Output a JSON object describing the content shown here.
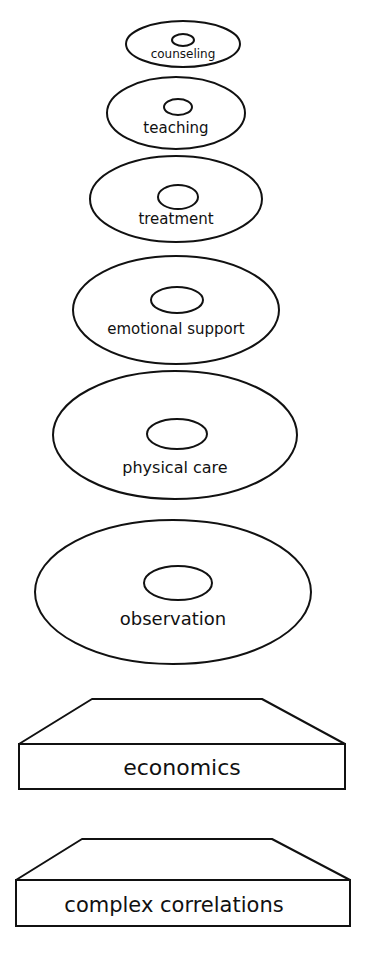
{
  "diagram": {
    "colors": {
      "stroke": "#111111",
      "background": "#ffffff"
    },
    "discs": [
      {
        "label": "counseling",
        "cx": 183,
        "cy": 44,
        "rx": 57,
        "ry": 23,
        "hx": 183,
        "hy": 40,
        "hrx": 11,
        "hry": 6,
        "ty": 58,
        "fs": 12
      },
      {
        "label": "teaching",
        "cx": 176,
        "cy": 113,
        "rx": 69,
        "ry": 36,
        "hx": 178,
        "hy": 107,
        "hrx": 14,
        "hry": 8,
        "ty": 133,
        "fs": 15
      },
      {
        "label": "treatment",
        "cx": 176,
        "cy": 199,
        "rx": 86,
        "ry": 43,
        "hx": 178,
        "hy": 197,
        "hrx": 20,
        "hry": 12,
        "ty": 224,
        "fs": 15
      },
      {
        "label": "emotional support",
        "cx": 176,
        "cy": 310,
        "rx": 103,
        "ry": 54,
        "hx": 177,
        "hy": 300,
        "hrx": 26,
        "hry": 13,
        "ty": 334,
        "fs": 15
      },
      {
        "label": "physical care",
        "cx": 175,
        "cy": 435,
        "rx": 122,
        "ry": 64,
        "hx": 177,
        "hy": 434,
        "hrx": 30,
        "hry": 15,
        "ty": 473,
        "fs": 16
      },
      {
        "label": "observation",
        "cx": 173,
        "cy": 592,
        "rx": 138,
        "ry": 72,
        "hx": 178,
        "hy": 583,
        "hrx": 34,
        "hry": 17,
        "ty": 625,
        "fs": 18
      }
    ],
    "blocks": [
      {
        "label": "economics",
        "top_y": 699,
        "top_x1": 92,
        "top_x2": 262,
        "base_x1": 19,
        "base_x2": 345,
        "mid_y": 744,
        "bottom_y": 789,
        "ty": 775,
        "tx": 182,
        "fs": 22
      },
      {
        "label": "complex correlations",
        "top_y": 839,
        "top_x1": 82,
        "top_x2": 272,
        "base_x1": 16,
        "base_x2": 350,
        "mid_y": 880,
        "bottom_y": 926,
        "ty": 912,
        "tx": 174,
        "fs": 21
      }
    ]
  }
}
